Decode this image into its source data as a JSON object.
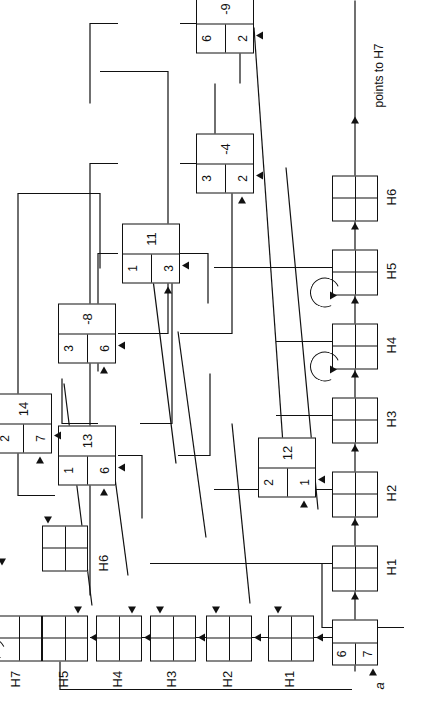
{
  "figure": {
    "kind": "hash-table-with-chaining-diagram",
    "orientation_note": "printed rotated 90 degrees",
    "page_rule": true,
    "start_pointer_label": "a",
    "tail_note": "points to H7"
  },
  "buckets": [
    {
      "id": "H1",
      "label": "H1"
    },
    {
      "id": "H2",
      "label": "H2"
    },
    {
      "id": "H3",
      "label": "H3"
    },
    {
      "id": "H4",
      "label": "H4",
      "self_loop": true
    },
    {
      "id": "H5",
      "label": "H5",
      "self_loop": true
    },
    {
      "id": "H6",
      "label": "H6"
    },
    {
      "id": "H7",
      "label": "H7",
      "self_loop": true
    }
  ],
  "header_row_labels": [
    "H1",
    "H2",
    "H3",
    "H4",
    "H5",
    "H6"
  ],
  "nodes": [
    {
      "id": "n-67",
      "key": "6 7",
      "value": "",
      "key_a": "6",
      "key_b": "7"
    },
    {
      "id": "n-21",
      "key": "2 1",
      "value": "12",
      "key_a": "2",
      "key_b": "1"
    },
    {
      "id": "n-32",
      "key": "3 2",
      "value": "-4",
      "key_a": "3",
      "key_b": "2"
    },
    {
      "id": "n-62",
      "key": "6 2",
      "value": "-9",
      "key_a": "6",
      "key_b": "2"
    },
    {
      "id": "n-13",
      "key": "1 3",
      "value": "11",
      "key_a": "1",
      "key_b": "3"
    },
    {
      "id": "n-16",
      "key": "1 6",
      "value": "13",
      "key_a": "1",
      "key_b": "6"
    },
    {
      "id": "n-36",
      "key": "3 6",
      "value": "-8",
      "key_a": "3",
      "key_b": "6"
    },
    {
      "id": "n-27",
      "key": "2 7",
      "value": "14",
      "key_a": "2",
      "key_b": "7"
    }
  ],
  "colors": {
    "ink": "#111111",
    "paper": "#ffffff"
  }
}
